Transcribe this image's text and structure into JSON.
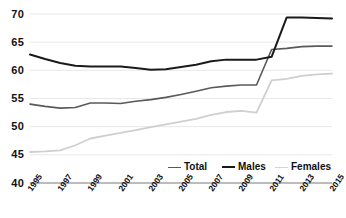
{
  "chart_data": {
    "type": "line",
    "title": "",
    "subtitle": "",
    "xlabel": "",
    "ylabel": "",
    "ylim": [
      40,
      70
    ],
    "yticks": [
      40,
      45,
      50,
      55,
      60,
      65,
      70
    ],
    "grid": true,
    "legend_position": "inside-bottom-right",
    "x": [
      1995,
      1996,
      1997,
      1998,
      1999,
      2000,
      2001,
      2002,
      2003,
      2004,
      2005,
      2006,
      2007,
      2008,
      2009,
      2010,
      2011,
      2012,
      2013,
      2014,
      2015
    ],
    "xtick_labels": [
      "1995",
      "1997",
      "1999",
      "2001",
      "2003",
      "2005",
      "2007",
      "2009",
      "2011",
      "2013",
      "2015"
    ],
    "xtick_values": [
      1995,
      1997,
      1999,
      2001,
      2003,
      2005,
      2007,
      2009,
      2011,
      2013,
      2015
    ],
    "series": [
      {
        "name": "Total",
        "color": "#595959",
        "width": 1.6,
        "values": [
          54.0,
          53.6,
          53.3,
          53.4,
          54.2,
          54.2,
          54.1,
          54.5,
          54.8,
          55.2,
          55.7,
          56.3,
          56.9,
          57.2,
          57.4,
          57.4,
          63.7,
          63.9,
          64.2,
          64.3,
          64.3
        ]
      },
      {
        "name": "Males",
        "color": "#1a1a1a",
        "width": 2.0,
        "values": [
          62.8,
          62.0,
          61.3,
          60.8,
          60.7,
          60.7,
          60.7,
          60.4,
          60.1,
          60.2,
          60.6,
          61.0,
          61.6,
          61.9,
          61.9,
          61.9,
          62.4,
          69.4,
          69.4,
          69.3,
          69.2
        ]
      },
      {
        "name": "Females",
        "color": "#cfcfcf",
        "width": 1.8,
        "values": [
          45.5,
          45.6,
          45.8,
          46.7,
          47.9,
          48.4,
          48.9,
          49.4,
          49.9,
          50.4,
          50.9,
          51.4,
          52.1,
          52.6,
          52.8,
          52.5,
          58.2,
          58.5,
          59.0,
          59.3,
          59.4
        ]
      }
    ],
    "legend": [
      {
        "label": "Total",
        "color": "#595959",
        "width": 1.6
      },
      {
        "label": "Males",
        "color": "#1a1a1a",
        "width": 2.2
      },
      {
        "label": "Females",
        "color": "#d4d4d4",
        "width": 1.8
      }
    ],
    "axis_color": "#a6a6a6",
    "grid_color": "#e8e8e8"
  }
}
